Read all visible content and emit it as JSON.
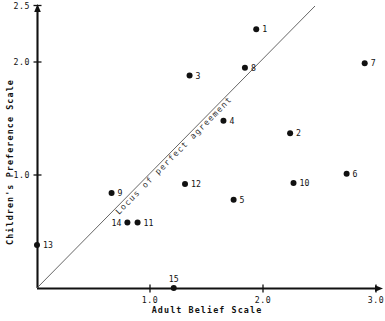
{
  "chart_data": {
    "type": "scatter",
    "title": "",
    "xlabel": "Adult Belief Scale",
    "ylabel": "Children's Preference Scale",
    "xlim": [
      0,
      3.0
    ],
    "ylim": [
      0,
      2.5
    ],
    "xticks": [
      "1.0",
      "2.0",
      "3.0"
    ],
    "xtick_values": [
      1.0,
      2.0,
      3.0
    ],
    "yticks": [
      "1.0",
      "2.0",
      "2.5"
    ],
    "ytick_values": [
      1.0,
      2.0,
      2.5
    ],
    "grid": false,
    "legend": "none",
    "annotations": [
      {
        "name": "locus-of-perfect-agreement",
        "text": "Locus of perfect agreement",
        "type": "reference-line",
        "line_from": [
          0,
          0
        ],
        "line_to": [
          2.46,
          2.5
        ],
        "slope": 1.0
      }
    ],
    "point_label_position": "right",
    "points": [
      {
        "label": "1",
        "x": 1.94,
        "y": 2.29
      },
      {
        "label": "2",
        "x": 2.24,
        "y": 1.37
      },
      {
        "label": "3",
        "x": 1.35,
        "y": 1.88
      },
      {
        "label": "4",
        "x": 1.65,
        "y": 1.48
      },
      {
        "label": "5",
        "x": 1.74,
        "y": 0.78
      },
      {
        "label": "6",
        "x": 2.74,
        "y": 1.01
      },
      {
        "label": "7",
        "x": 2.9,
        "y": 1.99
      },
      {
        "label": "8",
        "x": 1.84,
        "y": 1.95
      },
      {
        "label": "9",
        "x": 0.66,
        "y": 0.84
      },
      {
        "label": "10",
        "x": 2.27,
        "y": 0.93
      },
      {
        "label": "11",
        "x": 0.89,
        "y": 0.58
      },
      {
        "label": "12",
        "x": 1.31,
        "y": 0.92
      },
      {
        "label": "13",
        "x": 0.0,
        "y": 0.38
      },
      {
        "label": "14",
        "x": 0.8,
        "y": 0.58
      },
      {
        "label": "15",
        "x": 1.21,
        "y": 0.0
      }
    ]
  },
  "label_overrides": {
    "14": {
      "side": "left"
    },
    "15": {
      "side": "above"
    }
  }
}
